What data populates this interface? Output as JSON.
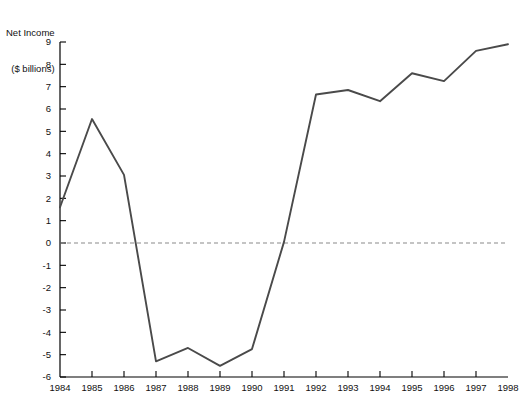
{
  "chart_data": {
    "type": "line",
    "title": "Net Income\n($ billions)",
    "title_line1": "Net Income",
    "title_line2": "($ billions)",
    "xlabel": "",
    "ylabel": "Net Income ($ billions)",
    "categories": [
      "1984",
      "1985",
      "1986",
      "1987",
      "1988",
      "1989",
      "1990",
      "1991",
      "1992",
      "1993",
      "1994",
      "1995",
      "1996",
      "1997",
      "1998"
    ],
    "x": [
      1984,
      1985,
      1986,
      1987,
      1988,
      1989,
      1990,
      1991,
      1992,
      1993,
      1994,
      1995,
      1996,
      1997,
      1998
    ],
    "values": [
      1.6,
      5.55,
      3.05,
      -5.3,
      -4.7,
      -5.5,
      -4.75,
      0.05,
      6.65,
      6.85,
      6.35,
      7.6,
      7.25,
      8.6,
      8.9
    ],
    "series": [
      {
        "name": "Net Income",
        "values": [
          1.6,
          5.55,
          3.05,
          -5.3,
          -4.7,
          -5.5,
          -4.75,
          0.05,
          6.65,
          6.85,
          6.35,
          7.6,
          7.25,
          8.6,
          8.9
        ],
        "color": "#4a4a4a"
      }
    ],
    "ylim": [
      -6,
      9
    ],
    "xlim": [
      1984,
      1998
    ],
    "yticks": [
      9,
      8,
      7,
      6,
      5,
      4,
      3,
      2,
      1,
      0,
      -1,
      -2,
      -3,
      -4,
      -5,
      -6
    ],
    "ytick_labels": [
      "9",
      "8",
      "7",
      "6",
      "5",
      "4",
      "3",
      "2",
      "1",
      "0",
      "-1",
      "-2",
      "-3",
      "-4",
      "-5",
      "-6"
    ],
    "xticks": [
      1984,
      1985,
      1986,
      1987,
      1988,
      1989,
      1990,
      1991,
      1992,
      1993,
      1994,
      1995,
      1996,
      1997,
      1998
    ],
    "xtick_labels": [
      "1984",
      "1985",
      "1986",
      "1987",
      "1988",
      "1989",
      "1990",
      "1991",
      "1992",
      "1993",
      "1994",
      "1995",
      "1996",
      "1997",
      "1998"
    ],
    "grid": false,
    "legend": false,
    "zero_line": {
      "value": 0,
      "style": "dashed",
      "color": "#8a8a8a"
    },
    "axis_color": "#000000",
    "line_color": "#4a4a4a",
    "background": "#ffffff"
  }
}
